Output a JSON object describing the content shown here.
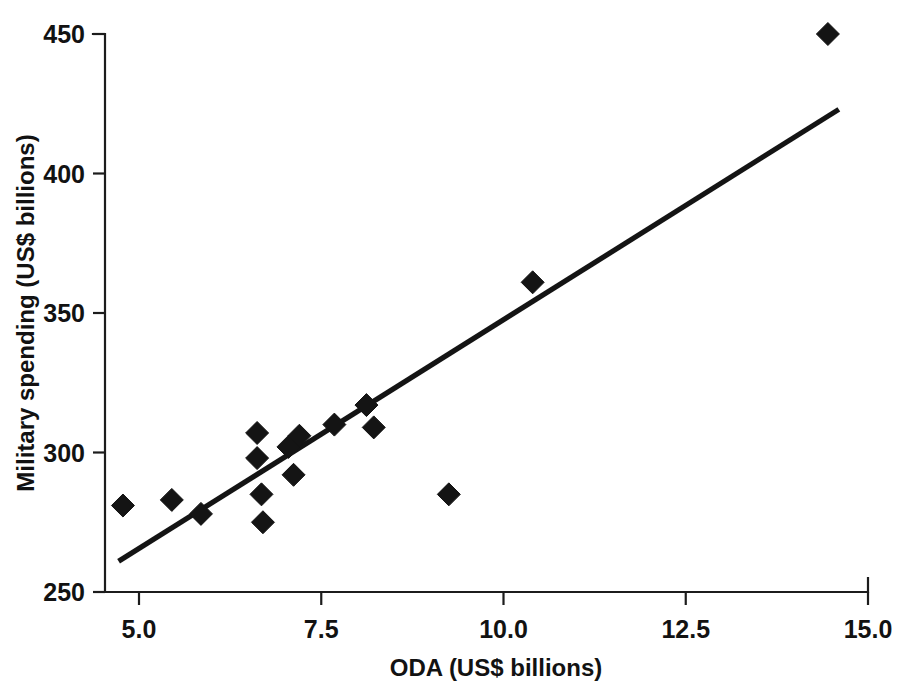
{
  "figure": {
    "background_color": "#ffffff",
    "ink_color": "#141414",
    "width": 903,
    "height": 693
  },
  "chart_data": {
    "type": "scatter",
    "title": "",
    "subtitle": "",
    "xlabel": "ODA (US$ billions)",
    "ylabel": "Military spending (US$ billions)",
    "xlim": [
      4.5,
      15.0
    ],
    "ylim": [
      250,
      450
    ],
    "xticks": [
      5.0,
      7.5,
      10.0,
      12.5,
      15.0
    ],
    "xtick_labels": [
      "5.0",
      "7.5",
      "10.0",
      "12.5",
      "15.0"
    ],
    "yticks": [
      250,
      300,
      350,
      400,
      450
    ],
    "ytick_labels": [
      "250",
      "300",
      "350",
      "400",
      "450"
    ],
    "grid": false,
    "legend": false,
    "legend_position": "none",
    "marker_shape": "diamond",
    "marker_color": "#141414",
    "series": [
      {
        "name": "Countries",
        "points": [
          {
            "x": 4.78,
            "y": 281
          },
          {
            "x": 5.45,
            "y": 283
          },
          {
            "x": 5.85,
            "y": 278
          },
          {
            "x": 6.62,
            "y": 307
          },
          {
            "x": 6.62,
            "y": 298
          },
          {
            "x": 6.68,
            "y": 285
          },
          {
            "x": 6.7,
            "y": 275
          },
          {
            "x": 7.05,
            "y": 302
          },
          {
            "x": 7.12,
            "y": 292
          },
          {
            "x": 7.2,
            "y": 306
          },
          {
            "x": 7.68,
            "y": 310
          },
          {
            "x": 8.12,
            "y": 317
          },
          {
            "x": 8.22,
            "y": 309
          },
          {
            "x": 9.25,
            "y": 285
          },
          {
            "x": 10.4,
            "y": 361
          },
          {
            "x": 14.45,
            "y": 450
          }
        ]
      }
    ],
    "trend_line": {
      "name": "Linear fit",
      "x_start": 4.72,
      "y_start": 261,
      "x_end": 14.6,
      "y_end": 423,
      "color": "#141414"
    }
  }
}
